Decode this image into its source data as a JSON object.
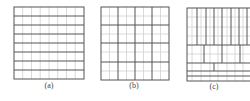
{
  "figure": {
    "panels": [
      {
        "id": "a",
        "label": "(a)",
        "label_pos": [
          49,
          81
        ],
        "box": [
          14,
          7,
          84,
          79
        ],
        "minor_v": [
          22.7,
          31.5,
          40.2,
          49,
          57.7,
          66.5,
          75.2
        ],
        "minor_h": [],
        "major_v": [],
        "major_h": [
          16,
          25,
          34,
          43,
          52,
          61,
          70
        ],
        "segments": []
      },
      {
        "id": "b",
        "label": "(b)",
        "label_pos": [
          134,
          81
        ],
        "box": [
          101,
          7,
          169,
          80
        ],
        "minor_v": [
          109.5,
          126.5,
          143.5,
          160.5
        ],
        "minor_h": [
          16,
          34,
          52,
          71
        ],
        "major_v": [
          118,
          135,
          152
        ],
        "major_h": [
          25,
          43,
          62
        ],
        "segments": []
      },
      {
        "id": "c",
        "label": "(c)",
        "label_pos": [
          214,
          82
        ],
        "box": [
          187,
          8,
          252,
          81
        ],
        "minor_v": [
          192,
          201,
          210,
          218,
          227,
          235,
          243
        ],
        "minor_h": [
          17,
          27,
          36,
          54
        ],
        "major_v": [],
        "major_h": [
          45,
          63,
          71,
          76
        ],
        "segments": [
          [
            197,
            8,
            197,
            45
          ],
          [
            206,
            8,
            206,
            45
          ],
          [
            214,
            8,
            214,
            45
          ],
          [
            222,
            8,
            222,
            45
          ],
          [
            231,
            8,
            231,
            45
          ],
          [
            239,
            8,
            239,
            45
          ],
          [
            247,
            8,
            247,
            45
          ],
          [
            204,
            45,
            204,
            63
          ],
          [
            222,
            45,
            222,
            63
          ],
          [
            240,
            45,
            240,
            63
          ],
          [
            214,
            63,
            214,
            71
          ]
        ]
      }
    ],
    "colors": {
      "major": "#555555",
      "minor": "#d0d0d0",
      "border": "#555555",
      "label": "#444444"
    }
  }
}
